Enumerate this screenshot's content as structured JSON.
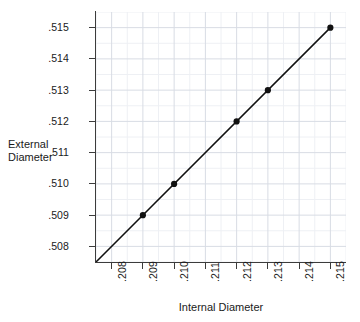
{
  "chart_data": {
    "type": "line",
    "title": "",
    "xlabel": "Internal Diameter",
    "ylabel": "External Diameter",
    "ylabel_lines": [
      "External",
      "Diameter"
    ],
    "xlim": [
      0.2075,
      0.2155
    ],
    "ylim": [
      0.5075,
      0.5155
    ],
    "xtick_labels": [
      ".208",
      ".209",
      ".210",
      ".211",
      ".212",
      ".213",
      ".214",
      ".215"
    ],
    "xticks": [
      0.208,
      0.209,
      0.21,
      0.211,
      0.212,
      0.213,
      0.214,
      0.215
    ],
    "ytick_labels": [
      ".508",
      ".509",
      ".510",
      ".511",
      ".512",
      ".513",
      ".514",
      ".515"
    ],
    "yticks": [
      0.508,
      0.509,
      0.51,
      0.511,
      0.512,
      0.513,
      0.514,
      0.515
    ],
    "grid": true,
    "minor_grid": true,
    "minor_divisions": 2,
    "legend": null,
    "x": [
      0.209,
      0.21,
      0.212,
      0.213,
      0.215
    ],
    "y": [
      0.509,
      0.51,
      0.512,
      0.513,
      0.515
    ],
    "line": {
      "from_x": 0.2075,
      "from_y": 0.5075,
      "to_x": 0.215,
      "to_y": 0.515,
      "color": "#111111",
      "width": 1.5
    },
    "marker": {
      "shape": "circle",
      "color": "#111111",
      "size": 3.1
    },
    "colors": {
      "background": "#ffffff",
      "plot_background": "#ffffff",
      "axis": "#3c3c3c",
      "major_grid": "#d8dce4",
      "minor_grid": "#eef0f4",
      "text": "#1a1a1a",
      "series": "#111111"
    }
  }
}
